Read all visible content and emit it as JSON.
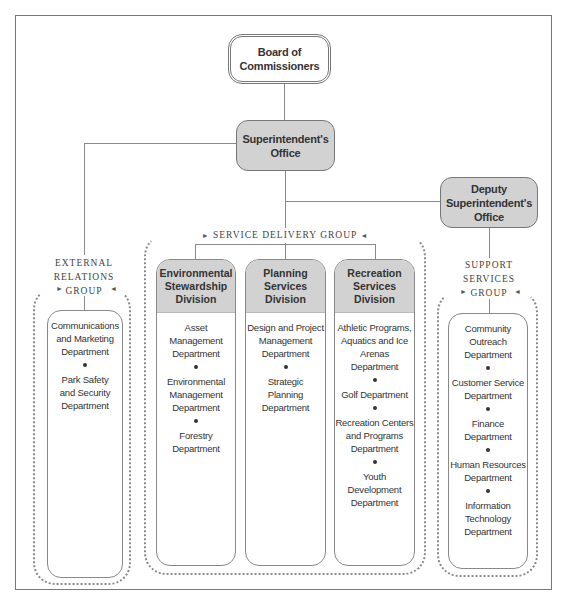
{
  "board": {
    "label_line1": "Board of",
    "label_line2": "Commissioners"
  },
  "superintendent": {
    "label_line1": "Superintendent's",
    "label_line2": "Office"
  },
  "deputy": {
    "label_line1": "Deputy",
    "label_line2": "Superintendent's",
    "label_line3": "Office"
  },
  "external_group": {
    "label_lines": [
      "EXTERNAL",
      "RELATIONS",
      "GROUP"
    ],
    "departments": [
      "Communications and Marketing Department",
      "Park Safety and Security Department"
    ]
  },
  "service_group": {
    "label": "SERVICE DELIVERY GROUP",
    "divisions": [
      {
        "title": "Environmental Stewardship Division",
        "departments": [
          "Asset Management Department",
          "Environmental Management Department",
          "Forestry Department"
        ]
      },
      {
        "title": "Planning Services Division",
        "departments": [
          "Design and Project Management Department",
          "Strategic Planning Department"
        ]
      },
      {
        "title": "Recreation Services Division",
        "departments": [
          "Athletic Programs, Aquatics and Ice Arenas Department",
          "Golf Department",
          "Recreation Centers and Programs Department",
          "Youth Development Department"
        ]
      }
    ]
  },
  "support_group": {
    "label_lines": [
      "SUPPORT",
      "SERVICES",
      "GROUP"
    ],
    "departments": [
      "Community Outreach Department",
      "Customer Service Department",
      "Finance Department",
      "Human Resources Department",
      "Information Technology Department"
    ]
  },
  "text": {
    "ext_d0": [
      "Communications",
      "and Marketing",
      "Department"
    ],
    "ext_d1": [
      "Park Safety",
      "and Security",
      "Department"
    ],
    "env_title": [
      "Environmental",
      "Stewardship",
      "Division"
    ],
    "env_d0": [
      "Asset",
      "Management",
      "Department"
    ],
    "env_d1": [
      "Environmental",
      "Management",
      "Department"
    ],
    "env_d2": [
      "Forestry",
      "Department"
    ],
    "plan_title": [
      "Planning",
      "Services",
      "Division"
    ],
    "plan_d0": [
      "Design and Project",
      "Management",
      "Department"
    ],
    "plan_d1": [
      "Strategic",
      "Planning",
      "Department"
    ],
    "rec_title": [
      "Recreation",
      "Services",
      "Division"
    ],
    "rec_d0": [
      "Athletic Programs,",
      "Aquatics and Ice",
      "Arenas",
      "Department"
    ],
    "rec_d1": [
      "Golf Department"
    ],
    "rec_d2": [
      "Recreation Centers",
      "and Programs",
      "Department"
    ],
    "rec_d3": [
      "Youth",
      "Development",
      "Department"
    ],
    "sup_d0": [
      "Community",
      "Outreach",
      "Department"
    ],
    "sup_d1": [
      "Customer Service",
      "Department"
    ],
    "sup_d2": [
      "Finance Department"
    ],
    "sup_d3": [
      "Human Resources",
      "Department"
    ],
    "sup_d4": [
      "Information",
      "Technology",
      "Department"
    ]
  },
  "icons": {
    "arrow_right": "►",
    "arrow_left": "◄"
  }
}
